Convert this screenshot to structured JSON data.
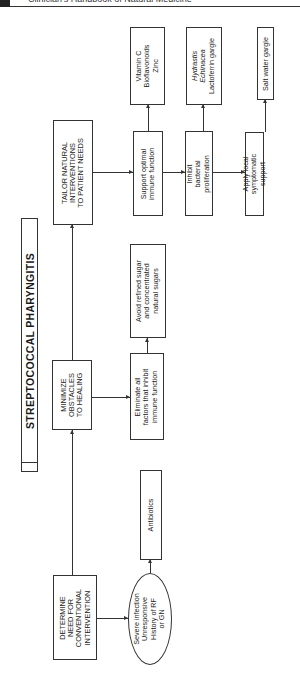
{
  "header": {
    "running_title": "Clinician's Handbook of Natural Medicine"
  },
  "diagram": {
    "title": "STREPTOCOCCAL PHARYNGITIS",
    "main_steps": [
      {
        "id": "determine",
        "lines": [
          "DETERMINE",
          "NEED FOR",
          "CONVENTIONAL",
          "INTERVENTION"
        ]
      },
      {
        "id": "minimize",
        "lines": [
          "MINIMIZE",
          "OBSTACLES",
          "TO HEALING"
        ]
      },
      {
        "id": "tailor",
        "lines": [
          "TAILOR NATURAL",
          "INTERVENTIONS",
          "TO PATIENT NEEDS"
        ]
      }
    ],
    "determine_branch": {
      "condition": [
        "Severe infection",
        "Unresponsive",
        "History of RF",
        "or GN"
      ],
      "action": "Antibiotics"
    },
    "minimize_branch": {
      "step": [
        "Eliminate all",
        "factors that inhibit",
        "immune function"
      ],
      "detail": [
        "Avoid refined sugar",
        "and concentrated",
        "natural sugars"
      ]
    },
    "tailor_branch": [
      {
        "step": [
          "Support optimal",
          "immune function"
        ],
        "detail": [
          "Vitamin C",
          "Bioflavonoids",
          "Zinc"
        ],
        "detail_italic": [
          false,
          false,
          false
        ]
      },
      {
        "step": [
          "Inhibit",
          "bacterial",
          "proliferation"
        ],
        "detail": [
          "Hydrastis",
          "Echinacea",
          "Lactoferrin gargle"
        ],
        "detail_italic": [
          true,
          true,
          false
        ]
      },
      {
        "step": [
          "Apply local",
          "symptomatic",
          "support"
        ],
        "detail": [
          "Salt water gargle"
        ],
        "detail_italic": [
          false
        ]
      }
    ]
  }
}
